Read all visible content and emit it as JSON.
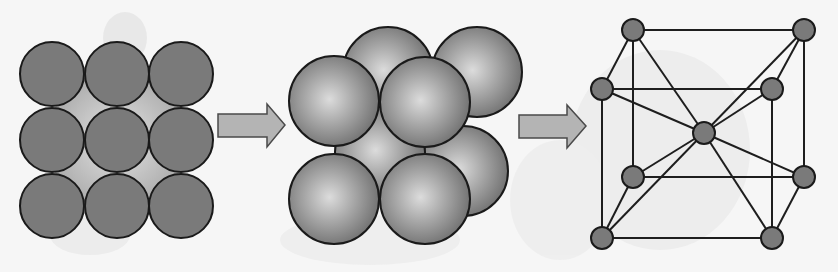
{
  "title": "Crystal lattice formation from packed atoms",
  "colors": {
    "background": "#f6f6f6",
    "atom_fill": "#7a7a7a",
    "outline": "#1a1a1a",
    "arrow_fill": "#b4b4b4",
    "arrow_stroke": "#4a4a4a",
    "lattice_line": "#1e1e1e"
  },
  "panels": [
    {
      "id": "layer-2d",
      "label": "Single layer of packed atoms (3x3 square array)",
      "circles": [
        {
          "cx": 52,
          "cy": 74,
          "r": 32
        },
        {
          "cx": 117,
          "cy": 74,
          "r": 32
        },
        {
          "cx": 181,
          "cy": 74,
          "r": 32
        },
        {
          "cx": 52,
          "cy": 140,
          "r": 32
        },
        {
          "cx": 117,
          "cy": 140,
          "r": 32
        },
        {
          "cx": 181,
          "cy": 140,
          "r": 32
        },
        {
          "cx": 52,
          "cy": 206,
          "r": 32
        },
        {
          "cx": 117,
          "cy": 206,
          "r": 32
        },
        {
          "cx": 181,
          "cy": 206,
          "r": 32
        }
      ]
    },
    {
      "id": "packed-spheres-3d",
      "label": "Body-centered cubic packing of spheres",
      "spheres_back": [
        {
          "cx": 388,
          "cy": 72,
          "r": 45
        },
        {
          "cx": 477,
          "cy": 72,
          "r": 45
        },
        {
          "cx": 463,
          "cy": 171,
          "r": 45
        },
        {
          "cx": 380,
          "cy": 152,
          "r": 45
        }
      ],
      "spheres_front": [
        {
          "cx": 334,
          "cy": 101,
          "r": 45
        },
        {
          "cx": 425,
          "cy": 102,
          "r": 45
        },
        {
          "cx": 334,
          "cy": 199,
          "r": 45
        },
        {
          "cx": 425,
          "cy": 199,
          "r": 45
        }
      ]
    },
    {
      "id": "unit-cell-lattice",
      "label": "Body-centered cubic unit cell",
      "node_r": 11,
      "nodes": {
        "back_top_left": [
          633,
          30
        ],
        "back_top_right": [
          804,
          30
        ],
        "front_top_left": [
          602,
          89
        ],
        "front_top_right": [
          772,
          89
        ],
        "center": [
          704,
          133
        ],
        "back_bottom_left": [
          633,
          177
        ],
        "back_bottom_right": [
          804,
          177
        ],
        "front_bottom_left": [
          602,
          238
        ],
        "front_bottom_right": [
          772,
          238
        ]
      },
      "edges": [
        [
          "back_top_left",
          "back_top_right"
        ],
        [
          "front_top_left",
          "front_top_right"
        ],
        [
          "back_bottom_left",
          "back_bottom_right"
        ],
        [
          "front_bottom_left",
          "front_bottom_right"
        ],
        [
          "back_top_left",
          "front_top_left"
        ],
        [
          "back_top_right",
          "front_top_right"
        ],
        [
          "back_bottom_left",
          "front_bottom_left"
        ],
        [
          "back_bottom_right",
          "front_bottom_right"
        ],
        [
          "back_top_left",
          "back_bottom_left"
        ],
        [
          "back_top_right",
          "back_bottom_right"
        ],
        [
          "front_top_left",
          "front_bottom_left"
        ],
        [
          "front_top_right",
          "front_bottom_right"
        ],
        [
          "center",
          "back_top_left"
        ],
        [
          "center",
          "back_top_right"
        ],
        [
          "center",
          "front_top_left"
        ],
        [
          "center",
          "front_top_right"
        ],
        [
          "center",
          "back_bottom_left"
        ],
        [
          "center",
          "back_bottom_right"
        ],
        [
          "center",
          "front_bottom_left"
        ],
        [
          "center",
          "front_bottom_right"
        ]
      ]
    }
  ],
  "arrows": [
    {
      "id": "arrow-1",
      "shaft": [
        218,
        114,
        267,
        137
      ],
      "head": [
        [
          267,
          104
        ],
        [
          285,
          125
        ],
        [
          267,
          147
        ]
      ]
    },
    {
      "id": "arrow-2",
      "shaft": [
        519,
        115,
        567,
        138
      ],
      "head": [
        [
          567,
          105
        ],
        [
          586,
          126
        ],
        [
          567,
          148
        ]
      ]
    }
  ]
}
